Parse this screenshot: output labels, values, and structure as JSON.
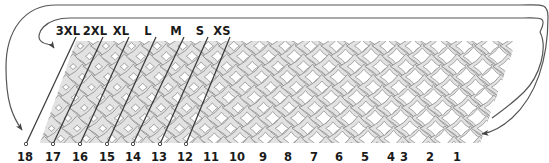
{
  "figure": {
    "type": "technical-diagram",
    "background_color": "#ffffff",
    "mesh": {
      "fill_color": "#e2e2e2",
      "hole_color": "#ffffff",
      "stroke_color": "#8a8a8a",
      "rows": 5,
      "columns": 18,
      "shape": "parallelogram",
      "skew_note": "cells sheared; open cell area increases from left to right"
    },
    "pointer_line_color": "#3a3a3a",
    "loop_line_color": "#555555"
  },
  "size_labels": {
    "color": "#1a1a1a",
    "items": [
      {
        "label": "3XL",
        "x": 68,
        "y": 26,
        "target_x": 52,
        "target_y": 140
      },
      {
        "label": "2XL",
        "x": 95,
        "y": 26,
        "target_x": 79,
        "target_y": 140
      },
      {
        "label": "XL",
        "x": 121,
        "y": 26,
        "target_x": 106,
        "target_y": 140
      },
      {
        "label": "L",
        "x": 148,
        "y": 26,
        "target_x": 133,
        "target_y": 140
      },
      {
        "label": "M",
        "x": 176,
        "y": 26,
        "target_x": 159,
        "target_y": 140
      },
      {
        "label": "S",
        "x": 200,
        "y": 26,
        "target_x": 186,
        "target_y": 140
      },
      {
        "label": "XS",
        "x": 222,
        "y": 26,
        "target_x": 212,
        "target_y": 140
      }
    ]
  },
  "column_numbers": {
    "color": "#1a1a1a",
    "y": 152,
    "items": [
      {
        "label": "18",
        "x": 25
      },
      {
        "label": "17",
        "x": 53
      },
      {
        "label": "16",
        "x": 80
      },
      {
        "label": "15",
        "x": 107
      },
      {
        "label": "14",
        "x": 133
      },
      {
        "label": "13",
        "x": 159
      },
      {
        "label": "12",
        "x": 185
      },
      {
        "label": "11",
        "x": 211
      },
      {
        "label": "10",
        "x": 237
      },
      {
        "label": "9",
        "x": 263
      },
      {
        "label": "8",
        "x": 288
      },
      {
        "label": "7",
        "x": 314
      },
      {
        "label": "6",
        "x": 339
      },
      {
        "label": "5",
        "x": 365
      },
      {
        "label": "4",
        "x": 391
      },
      {
        "label": "3",
        "x": 404
      },
      {
        "label": "2",
        "x": 430
      },
      {
        "label": "1",
        "x": 457
      }
    ]
  },
  "wrap_loops": [
    {
      "name": "inner-wrap-loop",
      "top_y": 18,
      "arrow_target_x": 54,
      "arrow_target_y": 48,
      "description": "wraps from right edge around to top-left of mesh"
    },
    {
      "name": "outer-wrap-loop",
      "top_y": 5,
      "arrow_target_x": 22,
      "arrow_target_y": 130,
      "description": "wraps from right edge around to lower-left of mesh"
    }
  ]
}
